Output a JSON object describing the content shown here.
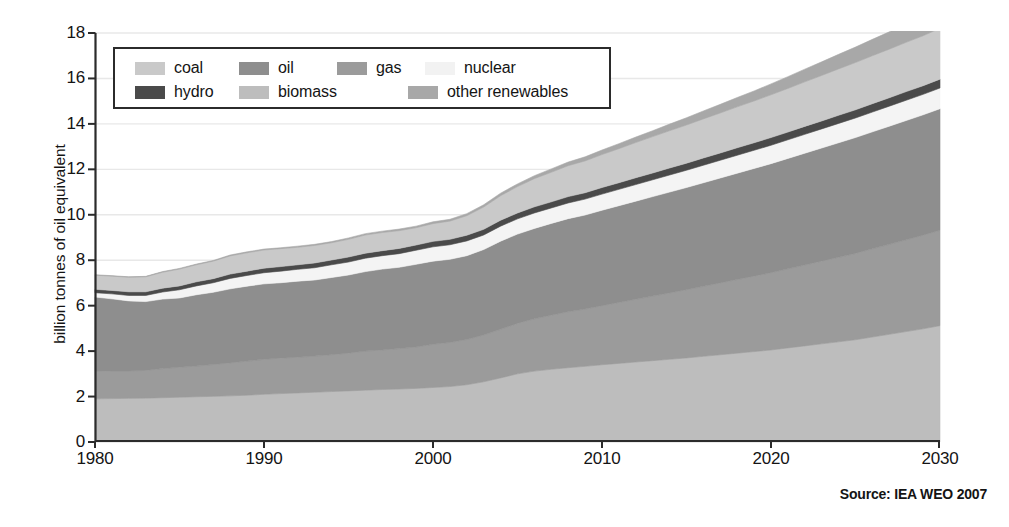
{
  "figure": {
    "source_note": "Source: IEA WEO 2007"
  },
  "chart_data": {
    "type": "area",
    "stacked": true,
    "title": "",
    "subtitle": "",
    "xlabel": "",
    "ylabel": "billion tonnes of oil equivalent",
    "xlim": [
      1980,
      2030
    ],
    "ylim": [
      0,
      18
    ],
    "xticks": [
      1980,
      1990,
      2000,
      2010,
      2020,
      2030
    ],
    "yticks": [
      0,
      2,
      4,
      6,
      8,
      10,
      12,
      14,
      16,
      18
    ],
    "grid": true,
    "grid_axis": "y",
    "legend_position": "upper-left",
    "legend_entries": [
      "coal",
      "oil",
      "gas",
      "nuclear",
      "hydro",
      "biomass",
      "other renewables"
    ],
    "stack_order_bottom_to_top": [
      "biomass",
      "gas",
      "oil",
      "nuclear",
      "hydro",
      "coal",
      "other renewables"
    ],
    "colors": {
      "coal": "#c9c9c9",
      "oil": "#8e8e8e",
      "gas": "#9b9b9b",
      "nuclear": "#f4f4f4",
      "hydro": "#4a4a4a",
      "biomass": "#bdbdbd",
      "other_renewables": "#a8a8a8",
      "axis": "#2b2b2b",
      "grid": "#e8e8e8",
      "text": "#141414"
    },
    "x": [
      1980,
      1981,
      1982,
      1983,
      1984,
      1985,
      1986,
      1987,
      1988,
      1989,
      1990,
      1991,
      1992,
      1993,
      1994,
      1995,
      1996,
      1997,
      1998,
      1999,
      2000,
      2001,
      2002,
      2003,
      2004,
      2005,
      2006,
      2007,
      2008,
      2009,
      2010,
      2011,
      2012,
      2013,
      2014,
      2015,
      2016,
      2017,
      2018,
      2019,
      2020,
      2021,
      2022,
      2023,
      2024,
      2025,
      2026,
      2027,
      2028,
      2029,
      2030
    ],
    "series": [
      {
        "name": "biomass",
        "color": "#bdbdbd",
        "values": [
          1.9,
          1.91,
          1.92,
          1.93,
          1.95,
          1.97,
          1.99,
          2.01,
          2.03,
          2.06,
          2.1,
          2.13,
          2.16,
          2.19,
          2.22,
          2.25,
          2.28,
          2.31,
          2.33,
          2.36,
          2.4,
          2.44,
          2.52,
          2.65,
          2.82,
          3.0,
          3.12,
          3.2,
          3.27,
          3.33,
          3.4,
          3.46,
          3.52,
          3.58,
          3.64,
          3.7,
          3.77,
          3.84,
          3.91,
          3.98,
          4.05,
          4.14,
          4.23,
          4.32,
          4.41,
          4.5,
          4.62,
          4.74,
          4.86,
          4.98,
          5.12
        ]
      },
      {
        "name": "gas",
        "color": "#9b9b9b",
        "values": [
          1.2,
          1.22,
          1.21,
          1.22,
          1.28,
          1.32,
          1.35,
          1.4,
          1.45,
          1.5,
          1.54,
          1.56,
          1.57,
          1.59,
          1.62,
          1.66,
          1.72,
          1.74,
          1.78,
          1.82,
          1.9,
          1.94,
          1.99,
          2.06,
          2.14,
          2.22,
          2.3,
          2.38,
          2.46,
          2.52,
          2.6,
          2.68,
          2.76,
          2.84,
          2.92,
          3.0,
          3.08,
          3.16,
          3.24,
          3.32,
          3.4,
          3.48,
          3.56,
          3.64,
          3.72,
          3.8,
          3.88,
          3.96,
          4.04,
          4.12,
          4.2
        ]
      },
      {
        "name": "oil",
        "color": "#8e8e8e",
        "values": [
          3.28,
          3.17,
          3.08,
          3.03,
          3.06,
          3.05,
          3.14,
          3.18,
          3.26,
          3.3,
          3.32,
          3.32,
          3.35,
          3.35,
          3.4,
          3.44,
          3.5,
          3.56,
          3.58,
          3.64,
          3.66,
          3.66,
          3.69,
          3.76,
          3.88,
          3.93,
          3.98,
          4.04,
          4.1,
          4.14,
          4.2,
          4.26,
          4.32,
          4.38,
          4.44,
          4.5,
          4.56,
          4.62,
          4.68,
          4.74,
          4.8,
          4.86,
          4.92,
          4.98,
          5.04,
          5.1,
          5.15,
          5.2,
          5.25,
          5.3,
          5.35
        ]
      },
      {
        "name": "nuclear",
        "color": "#f4f4f4",
        "values": [
          0.19,
          0.22,
          0.24,
          0.27,
          0.31,
          0.36,
          0.39,
          0.42,
          0.46,
          0.47,
          0.49,
          0.51,
          0.52,
          0.54,
          0.56,
          0.57,
          0.59,
          0.59,
          0.6,
          0.62,
          0.63,
          0.64,
          0.65,
          0.64,
          0.66,
          0.67,
          0.68,
          0.68,
          0.69,
          0.7,
          0.71,
          0.72,
          0.73,
          0.74,
          0.75,
          0.76,
          0.77,
          0.78,
          0.79,
          0.8,
          0.81,
          0.82,
          0.83,
          0.84,
          0.85,
          0.86,
          0.87,
          0.88,
          0.89,
          0.9,
          0.91
        ]
      },
      {
        "name": "hydro",
        "color": "#4a4a4a",
        "values": [
          0.15,
          0.15,
          0.16,
          0.16,
          0.17,
          0.17,
          0.18,
          0.18,
          0.19,
          0.19,
          0.2,
          0.2,
          0.2,
          0.21,
          0.21,
          0.22,
          0.22,
          0.22,
          0.23,
          0.23,
          0.24,
          0.24,
          0.25,
          0.25,
          0.26,
          0.26,
          0.27,
          0.27,
          0.28,
          0.28,
          0.29,
          0.29,
          0.3,
          0.3,
          0.31,
          0.31,
          0.32,
          0.32,
          0.33,
          0.33,
          0.34,
          0.34,
          0.35,
          0.35,
          0.36,
          0.36,
          0.37,
          0.37,
          0.38,
          0.38,
          0.39
        ]
      },
      {
        "name": "coal",
        "color": "#c9c9c9",
        "values": [
          0.62,
          0.63,
          0.64,
          0.66,
          0.7,
          0.74,
          0.75,
          0.77,
          0.8,
          0.81,
          0.8,
          0.79,
          0.77,
          0.77,
          0.76,
          0.78,
          0.8,
          0.8,
          0.78,
          0.76,
          0.78,
          0.8,
          0.86,
          0.98,
          1.08,
          1.16,
          1.24,
          1.3,
          1.36,
          1.4,
          1.45,
          1.5,
          1.55,
          1.6,
          1.64,
          1.68,
          1.72,
          1.76,
          1.8,
          1.84,
          1.88,
          1.92,
          1.96,
          2.0,
          2.04,
          2.08,
          2.11,
          2.14,
          2.17,
          2.2,
          2.24
        ]
      },
      {
        "name": "other renewables",
        "color": "#a8a8a8",
        "values": [
          0.02,
          0.02,
          0.02,
          0.02,
          0.03,
          0.03,
          0.03,
          0.03,
          0.04,
          0.04,
          0.04,
          0.04,
          0.05,
          0.05,
          0.05,
          0.06,
          0.06,
          0.06,
          0.07,
          0.07,
          0.08,
          0.08,
          0.09,
          0.1,
          0.11,
          0.12,
          0.13,
          0.15,
          0.16,
          0.18,
          0.2,
          0.22,
          0.24,
          0.26,
          0.29,
          0.32,
          0.35,
          0.38,
          0.41,
          0.44,
          0.48,
          0.52,
          0.56,
          0.6,
          0.64,
          0.68,
          0.72,
          0.76,
          0.8,
          0.84,
          0.88
        ]
      }
    ],
    "totals_selected": {
      "1980": 7.36,
      "1990": 8.49,
      "2000": 9.69,
      "2010": 12.85,
      "2020": 15.76,
      "2030": 19.09
    }
  },
  "legend": {
    "row1": [
      {
        "label": "coal",
        "color_key": "coal"
      },
      {
        "label": "oil",
        "color_key": "oil"
      },
      {
        "label": "gas",
        "color_key": "gas"
      },
      {
        "label": "nuclear",
        "color_key": "nuclear"
      }
    ],
    "row2": [
      {
        "label": "hydro",
        "color_key": "hydro"
      },
      {
        "label": "biomass",
        "color_key": "biomass"
      },
      {
        "label": "other renewables",
        "color_key": "other_renewables"
      }
    ]
  }
}
